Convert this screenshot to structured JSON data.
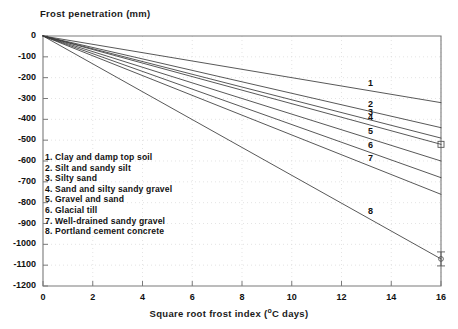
{
  "chart_data": {
    "type": "line",
    "title": "",
    "ylabel": "Frost penetration (mm)",
    "xlabel": "Square root frost index (°C days)",
    "xlim": [
      0,
      16
    ],
    "ylim": [
      -1200,
      0
    ],
    "grid": true,
    "legend_position": "inside-left",
    "xticks": [
      "0",
      "2",
      "4",
      "6",
      "8",
      "10",
      "12",
      "14",
      "16"
    ],
    "xtick_values": [
      0,
      2,
      4,
      6,
      8,
      10,
      12,
      14,
      16
    ],
    "yticks": [
      "0",
      "-100",
      "-200",
      "-300",
      "-400",
      "-500",
      "-600",
      "-700",
      "-800",
      "-900",
      "-1000",
      "-1100",
      "-1200"
    ],
    "ytick_values": [
      0,
      -100,
      -200,
      -300,
      -400,
      -500,
      -600,
      -700,
      -800,
      -900,
      -1000,
      -1100,
      -1200
    ],
    "series": [
      {
        "name": "1",
        "label": "1. Clay and damp top soil",
        "x": [
          0,
          16
        ],
        "values": [
          0,
          -320
        ],
        "slope": -20.0,
        "end_label": "1"
      },
      {
        "name": "2",
        "label": "2. Silt and sandy silt",
        "x": [
          0,
          16
        ],
        "values": [
          0,
          -440
        ],
        "slope": -27.5,
        "end_label": "2"
      },
      {
        "name": "3",
        "label": "3. Silty sand",
        "x": [
          0,
          16
        ],
        "values": [
          0,
          -490
        ],
        "slope": -30.6,
        "end_label": "3"
      },
      {
        "name": "4",
        "label": "4. Sand and silty sandy gravel",
        "x": [
          0,
          16
        ],
        "values": [
          0,
          -520
        ],
        "slope": -32.5,
        "end_label": "4"
      },
      {
        "name": "5",
        "label": "5. Gravel and sand",
        "x": [
          0,
          16
        ],
        "values": [
          0,
          -600
        ],
        "slope": -37.5,
        "end_label": "5"
      },
      {
        "name": "6",
        "label": "6. Glacial till",
        "x": [
          0,
          16
        ],
        "values": [
          0,
          -680
        ],
        "slope": -42.5,
        "end_label": "6"
      },
      {
        "name": "7",
        "label": "7. Well-drained sandy gravel",
        "x": [
          0,
          16
        ],
        "values": [
          0,
          -760
        ],
        "slope": -47.5,
        "end_label": "7"
      },
      {
        "name": "8",
        "label": "8. Portland cement concrete",
        "x": [
          0,
          16
        ],
        "values": [
          0,
          -1070
        ],
        "slope": -66.9,
        "end_label": "8"
      }
    ],
    "markers": [
      {
        "name": "marker-line-4",
        "x": 16,
        "y": -520,
        "shape": "square"
      },
      {
        "name": "marker-line-8",
        "x": 16,
        "y": -1070,
        "shape": "error-bar"
      }
    ],
    "line_color": "#3a3a3a",
    "axis_color": "#7a7a7a",
    "grid_color": "#d8d8d8",
    "text_color": "#111111"
  }
}
